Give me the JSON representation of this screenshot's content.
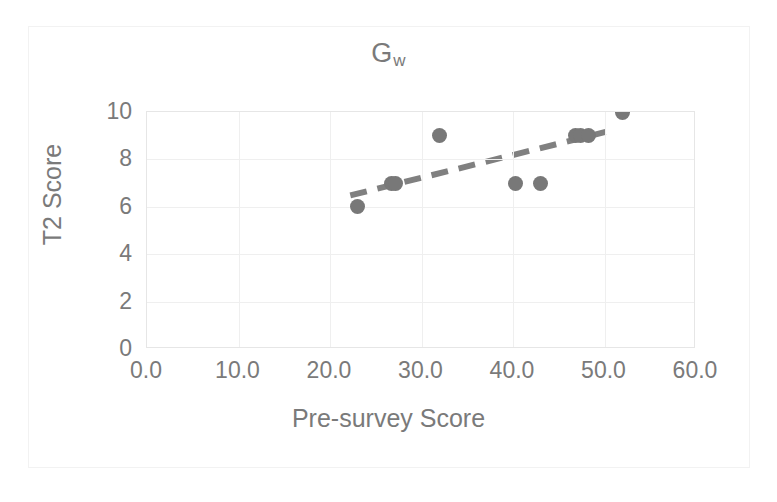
{
  "chart_data": {
    "type": "scatter",
    "title": "Gw",
    "title_base": "G",
    "title_subscript": "w",
    "xlabel": "Pre-survey Score",
    "ylabel": "T2 Score",
    "xlim": [
      0,
      60
    ],
    "ylim": [
      0,
      10
    ],
    "xticks": [
      "0.0",
      "10.0",
      "20.0",
      "30.0",
      "40.0",
      "50.0",
      "60.0"
    ],
    "xtick_values": [
      0,
      10,
      20,
      30,
      40,
      50,
      60
    ],
    "yticks": [
      "0",
      "2",
      "4",
      "6",
      "8",
      "10"
    ],
    "ytick_values": [
      0,
      2,
      4,
      6,
      8,
      10
    ],
    "grid": true,
    "legend": "none",
    "series": [
      {
        "name": "Gw participants",
        "marker": "circle",
        "color": "#787878",
        "points": [
          {
            "x": 23.0,
            "y": 6
          },
          {
            "x": 26.7,
            "y": 7
          },
          {
            "x": 27.2,
            "y": 7
          },
          {
            "x": 32.0,
            "y": 9
          },
          {
            "x": 40.3,
            "y": 7
          },
          {
            "x": 43.0,
            "y": 7
          },
          {
            "x": 46.8,
            "y": 9
          },
          {
            "x": 47.4,
            "y": 9
          },
          {
            "x": 48.2,
            "y": 9
          },
          {
            "x": 52.0,
            "y": 10
          }
        ]
      }
    ],
    "trendline": {
      "style": "dashed",
      "color": "#808080",
      "x_start": 22.3,
      "y_start": 6.45,
      "x_end": 50.3,
      "y_end": 9.15
    },
    "colors": {
      "marker": "#787878",
      "trendline": "#808080",
      "text": "#7a7a7a",
      "gridline": "#efefef",
      "axis": "#e6e6e6",
      "frame": "#f2f2f2",
      "background": "#ffffff"
    }
  }
}
